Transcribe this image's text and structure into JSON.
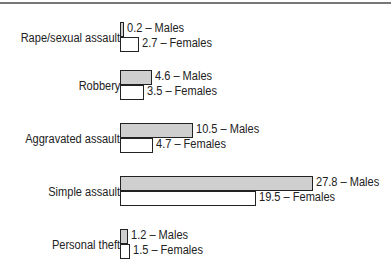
{
  "chart_data": {
    "type": "bar",
    "orientation": "horizontal",
    "title": "",
    "xlabel": "",
    "ylabel": "",
    "categories": [
      "Rape/sexual assault",
      "Robbery",
      "Aggravated assault",
      "Simple assault",
      "Personal theft"
    ],
    "series": [
      {
        "name": "Males",
        "values": [
          0.2,
          4.6,
          10.5,
          27.8,
          1.2
        ],
        "color": "#cfcfcf"
      },
      {
        "name": "Females",
        "values": [
          2.7,
          3.5,
          4.7,
          19.5,
          1.5
        ],
        "color": "#ffffff"
      }
    ],
    "legend": "inline data labels",
    "grid": false,
    "xlim": [
      0,
      30
    ]
  },
  "labels": {
    "g0": {
      "cat": "Rape/sexual assault",
      "m": "0.2 – Males",
      "f": "2.7 – Females"
    },
    "g1": {
      "cat": "Robbery",
      "m": "4.6 – Males",
      "f": "3.5 – Females"
    },
    "g2": {
      "cat": "Aggravated assault",
      "m": "10.5 – Males",
      "f": "4.7 – Females"
    },
    "g3": {
      "cat": "Simple assault",
      "m": "27.8 – Males",
      "f": "19.5 – Females"
    },
    "g4": {
      "cat": "Personal theft",
      "m": "1.2 – Males",
      "f": "1.5 – Females"
    }
  }
}
